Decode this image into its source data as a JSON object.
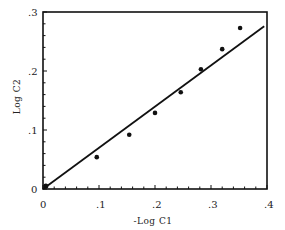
{
  "chart_data": {
    "type": "scatter",
    "title": "",
    "xlabel": "-Log C1",
    "ylabel": "Log C2",
    "xlim": [
      0,
      0.4
    ],
    "ylim": [
      0,
      0.3
    ],
    "grid": false,
    "legend": null,
    "x_ticks": [
      "0",
      ".1",
      ".2",
      ".3",
      ".4"
    ],
    "y_ticks": [
      "0",
      ".1",
      ".2",
      ".3"
    ],
    "series": [
      {
        "name": "data",
        "kind": "points",
        "x": [
          0.005,
          0.096,
          0.154,
          0.2,
          0.246,
          0.282,
          0.32,
          0.352
        ],
        "y": [
          0.005,
          0.054,
          0.092,
          0.129,
          0.164,
          0.203,
          0.237,
          0.273
        ]
      },
      {
        "name": "fit",
        "kind": "line",
        "x": [
          0.0,
          0.395
        ],
        "y": [
          0.0,
          0.276
        ]
      }
    ]
  },
  "labels": {
    "xlabel": "-Log C1",
    "ylabel": "Log C2",
    "x_ticks": [
      "0",
      ".1",
      ".2",
      ".3",
      ".4"
    ],
    "y_ticks": [
      "0",
      ".1",
      ".2",
      ".3"
    ]
  }
}
